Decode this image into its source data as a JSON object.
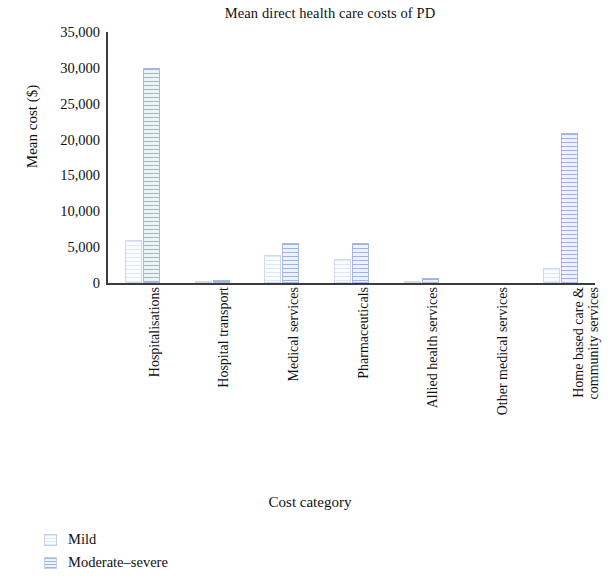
{
  "chart_data": {
    "type": "bar",
    "title": "Mean direct health care costs of PD",
    "xlabel": "Cost category",
    "ylabel": "Mean cost ($)",
    "ylim": [
      0,
      35000
    ],
    "ytick_labels": [
      "35,000",
      "30,000",
      "25,000",
      "20,000",
      "15,000",
      "10,000",
      "5,000",
      "0"
    ],
    "ytick_values": [
      35000,
      30000,
      25000,
      20000,
      15000,
      10000,
      5000,
      0
    ],
    "grid": false,
    "legend_position": "below-bottom-left",
    "categories": [
      "Hospitalisations",
      "Hospital transport",
      "Medical services",
      "Pharmaceuticals",
      "Allied health services",
      "Other medical services",
      "Home based care & community services"
    ],
    "category_lines": [
      [
        "Hospitalisations"
      ],
      [
        "Hospital transport"
      ],
      [
        "Medical services"
      ],
      [
        "Pharmaceuticals"
      ],
      [
        "Allied health services"
      ],
      [
        "Other medical services"
      ],
      [
        "Home based care &",
        "community services"
      ]
    ],
    "series": [
      {
        "name": "Mild",
        "color": "#f2f5fd",
        "values": [
          6000,
          100,
          3900,
          3300,
          300,
          0,
          2100
        ]
      },
      {
        "name": "Moderate–severe",
        "color": "#9fb4de",
        "values": [
          30000,
          400,
          5600,
          5600,
          700,
          0,
          20900
        ]
      }
    ]
  },
  "legend": {
    "items": [
      {
        "label": "Mild",
        "swatch": "mild"
      },
      {
        "label": "Moderate–severe",
        "swatch": "mod"
      }
    ]
  }
}
